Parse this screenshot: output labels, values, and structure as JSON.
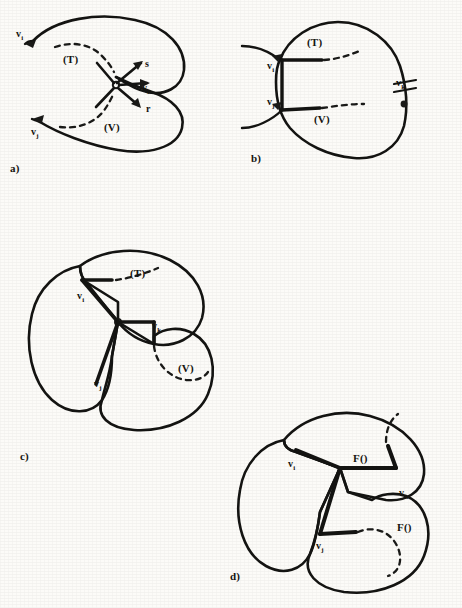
{
  "figure": {
    "caption_letters": [
      "a)",
      "b)",
      "c)",
      "d)"
    ],
    "style": {
      "ink_color": "#1a1a18",
      "paper_color": "#fcfbf8"
    }
  },
  "panels": [
    {
      "id": "a",
      "letter": "a)",
      "labels": {
        "region_t": "(T)",
        "region_v": "(V)",
        "vertex_i": "v",
        "vertex_i_sub": "i",
        "vertex_j": "v",
        "vertex_j_sub": "j",
        "vertex_k": "v",
        "vertex_k_sub": "k",
        "vector_s": "s",
        "vector_r": "r"
      }
    },
    {
      "id": "b",
      "letter": "b)",
      "labels": {
        "region_t": "(T)",
        "region_v": "(V)",
        "vertex_i": "v",
        "vertex_i_sub": "i",
        "vertex_j": "v",
        "vertex_j_sub": "j",
        "vertex_k": "v",
        "vertex_k_sub": "k"
      }
    },
    {
      "id": "c",
      "letter": "c)",
      "labels": {
        "region_t": "(T)",
        "region_v": "(V)",
        "vertex_i": "v",
        "vertex_i_sub": "i",
        "vertex_j": "v",
        "vertex_j_sub": "j",
        "vertex_k": "v",
        "vertex_k_sub": "k"
      }
    },
    {
      "id": "d",
      "letter": "d)",
      "labels": {
        "func_upper": "F()",
        "func_lower": "F()",
        "vertex_i": "v",
        "vertex_i_sub": "i",
        "vertex_j": "v",
        "vertex_j_sub": "j",
        "vertex_k": "v",
        "vertex_k_sub": "k"
      }
    }
  ]
}
